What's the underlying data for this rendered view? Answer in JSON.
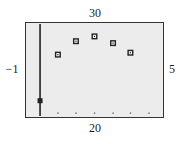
{
  "window_labels": {
    "ymax": "30",
    "ymin": "20",
    "xmin": "−1",
    "xmax": "5"
  },
  "chart_data": {
    "type": "scatter",
    "title": "",
    "xlabel": "",
    "ylabel": "",
    "xlim": [
      -1,
      5
    ],
    "ylim": [
      20,
      30
    ],
    "grid": false,
    "tick_label_positions": {
      "top": "30",
      "bottom": "20",
      "left": "−1",
      "right": "5"
    },
    "series": [
      {
        "name": "open-square points",
        "marker": "square",
        "x": [
          0.42,
          1.2,
          2.0,
          2.8,
          3.55
        ],
        "y": [
          26.6,
          28.0,
          28.5,
          27.8,
          26.8
        ]
      },
      {
        "name": "filled point on vertical line",
        "marker": "filled-square",
        "x": [
          -0.35
        ],
        "y": [
          21.8
        ]
      }
    ],
    "vertical_line": {
      "x": -0.35,
      "y_from": 20,
      "y_to": 29.8
    },
    "x_tick_dots": [
      0.42,
      1.2,
      2.0,
      2.8,
      3.55,
      4.35
    ]
  },
  "colors": {
    "frame": "#333333",
    "plot_bg": "#ececec",
    "marker": "#222222"
  }
}
